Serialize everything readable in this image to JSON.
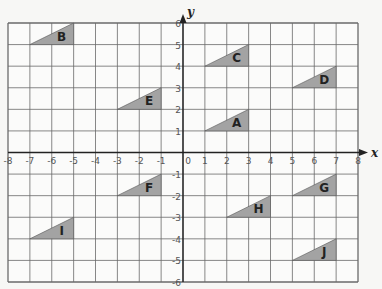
{
  "chart_data": {
    "type": "coordinate-grid",
    "title": "",
    "xlabel": "x",
    "ylabel": "y",
    "xlim": [
      -8,
      8
    ],
    "ylim": [
      -6,
      6
    ],
    "grid": true,
    "x_ticks": [
      "-8",
      "-7",
      "-6",
      "-5",
      "-4",
      "-3",
      "-2",
      "-1",
      "0",
      "1",
      "2",
      "3",
      "4",
      "5",
      "6",
      "7",
      "8"
    ],
    "y_ticks": [
      "6",
      "5",
      "4",
      "3",
      "2",
      "1",
      "-1",
      "-2",
      "-3",
      "-4",
      "-5",
      "-6"
    ],
    "shapes": [
      {
        "label": "A",
        "vertices": [
          [
            1,
            1
          ],
          [
            3,
            1
          ],
          [
            3,
            2
          ]
        ]
      },
      {
        "label": "B",
        "vertices": [
          [
            -7,
            5
          ],
          [
            -5,
            5
          ],
          [
            -5,
            6
          ]
        ]
      },
      {
        "label": "C",
        "vertices": [
          [
            1,
            4
          ],
          [
            3,
            4
          ],
          [
            3,
            5
          ]
        ]
      },
      {
        "label": "D",
        "vertices": [
          [
            5,
            3
          ],
          [
            7,
            3
          ],
          [
            7,
            4
          ]
        ]
      },
      {
        "label": "E",
        "vertices": [
          [
            -3,
            2
          ],
          [
            -1,
            2
          ],
          [
            -1,
            3
          ]
        ]
      },
      {
        "label": "F",
        "vertices": [
          [
            -3,
            -2
          ],
          [
            -1,
            -2
          ],
          [
            -1,
            -1
          ]
        ]
      },
      {
        "label": "G",
        "vertices": [
          [
            5,
            -2
          ],
          [
            7,
            -2
          ],
          [
            7,
            -1
          ]
        ]
      },
      {
        "label": "H",
        "vertices": [
          [
            2,
            -3
          ],
          [
            4,
            -3
          ],
          [
            4,
            -2
          ]
        ]
      },
      {
        "label": "I",
        "vertices": [
          [
            -7,
            -4
          ],
          [
            -5,
            -4
          ],
          [
            -5,
            -3
          ]
        ]
      },
      {
        "label": "J",
        "vertices": [
          [
            5,
            -5
          ],
          [
            7,
            -5
          ],
          [
            7,
            -4
          ]
        ]
      }
    ]
  },
  "colors": {
    "triangle_fill": "#a3a3a3",
    "grid_line": "#6a6a6a",
    "axis_line": "#222222",
    "background": "#f7f7f5",
    "plot_background": "#fbfbfa"
  }
}
